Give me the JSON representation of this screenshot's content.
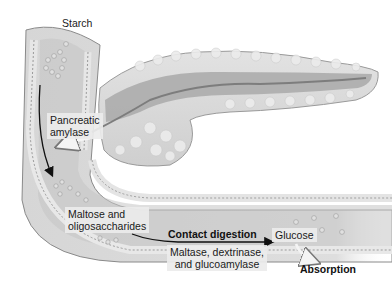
{
  "diagram": {
    "labels": {
      "starch": "Starch",
      "pancreatic_amylase_1": "Pancreatic",
      "pancreatic_amylase_2": "amylase",
      "maltose_1": "Maltose and",
      "maltose_2": "oligosaccharides",
      "contact_digestion": "Contact digestion",
      "enzymes_1": "Maltase, dextrinase,",
      "enzymes_2": "and glucoamylase",
      "glucose": "Glucose",
      "absorption": "Absorption"
    },
    "structures": [
      "pancreas",
      "pancreatic-duct",
      "duodenum",
      "small-intestine",
      "intestinal-wall",
      "microvilli"
    ],
    "colors": {
      "tissue_light": "#d9d9d9",
      "tissue_mid": "#a8a8a8",
      "tissue_dark": "#6e6e6e",
      "lumen": "#bdbdbd",
      "background": "#ffffff",
      "text": "#1a1a1a"
    }
  }
}
